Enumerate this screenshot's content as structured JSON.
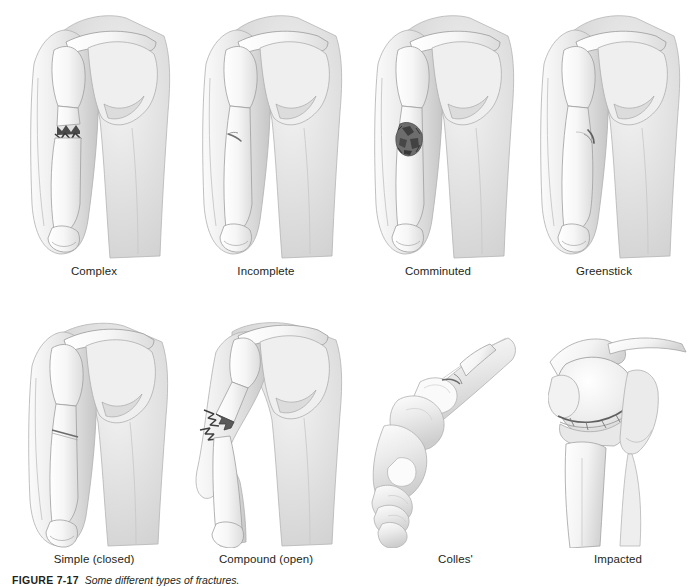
{
  "figure": {
    "background_color": "#ffffff",
    "ink_color": "#231f20",
    "caption_number": "FIGURE 7-17",
    "caption_text": "Some different types of fractures.",
    "rows": [
      {
        "row_index": 0,
        "panels": [
          {
            "label": "Complex",
            "art": "shoulder-arm-humerus-complex-fracture",
            "description": "Grayscale anatomical drawing of a right shoulder and upper arm showing the clavicle, scapula and humerus with a jagged displaced break in the humeral shaft"
          },
          {
            "label": "Incomplete",
            "art": "shoulder-arm-humerus-incomplete-fracture",
            "description": "Grayscale anatomical drawing of shoulder and upper arm with a partial crack that does not pass all the way through the humerus"
          },
          {
            "label": "Comminuted",
            "art": "shoulder-arm-humerus-comminuted-fracture",
            "description": "Grayscale anatomical drawing of shoulder and upper arm with the humeral shaft shattered into multiple small fragments"
          },
          {
            "label": "Greenstick",
            "art": "shoulder-arm-humerus-greenstick-fracture",
            "description": "Grayscale anatomical drawing of shoulder and upper arm with the humerus bent and split on one side only"
          }
        ]
      },
      {
        "row_index": 1,
        "panels": [
          {
            "label": "Simple (closed)",
            "art": "shoulder-arm-humerus-simple-closed-fracture",
            "description": "Grayscale anatomical drawing of shoulder and upper arm with a clean break of the humerus that does not pierce the skin"
          },
          {
            "label": "Compound (open)",
            "art": "shoulder-arm-humerus-compound-open-fracture",
            "description": "Grayscale anatomical drawing of shoulder and upper arm with broken humeral ends protruding through the skin"
          },
          {
            "label": "Colles'",
            "art": "hand-wrist-colles-fracture",
            "description": "Grayscale anatomical drawing of a hand and wrist in the dinner-fork deformity of a distal radius Colles' fracture"
          },
          {
            "label": "Impacted",
            "art": "shoulder-humerus-impacted-fracture",
            "description": "Grayscale anatomical drawing of a shoulder joint with the humeral head driven into the humeral shaft"
          }
        ]
      }
    ]
  }
}
